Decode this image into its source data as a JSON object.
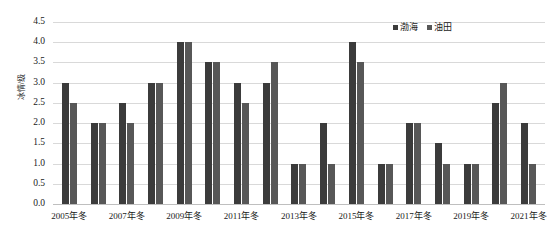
{
  "chart_data": {
    "type": "bar",
    "title": "",
    "subtitle": "",
    "xlabel": "",
    "ylabel": "冰情/级",
    "ylim": [
      0.0,
      4.5
    ],
    "ytick_step": 0.5,
    "yticks": [
      "0.0",
      "0.5",
      "1.0",
      "1.5",
      "2.0",
      "2.5",
      "3.0",
      "3.5",
      "4.0",
      "4.5"
    ],
    "ytick_values": [
      0.0,
      0.5,
      1.0,
      1.5,
      2.0,
      2.5,
      3.0,
      3.5,
      4.0,
      4.5
    ],
    "grid": true,
    "grid_axis": "y",
    "legend_position": "top-right",
    "categories": [
      "2005年冬",
      "2006年冬",
      "2007年冬",
      "2008年冬",
      "2009年冬",
      "2010年冬",
      "2011年冬",
      "2012年冬",
      "2013年冬",
      "2014年冬",
      "2015年冬",
      "2016年冬",
      "2017年冬",
      "2018年冬",
      "2019年冬",
      "2020年冬",
      "2021年冬"
    ],
    "xtick_labels": [
      "2005年冬",
      "",
      "2007年冬",
      "",
      "2009年冬",
      "",
      "2011年冬",
      "",
      "2013年冬",
      "",
      "2015年冬",
      "",
      "2017年冬",
      "",
      "2019年冬",
      "",
      "2021年冬"
    ],
    "series": [
      {
        "name": "渤海",
        "color": "#3b3b3b",
        "values": [
          3.0,
          2.0,
          2.5,
          3.0,
          4.0,
          3.5,
          3.0,
          3.0,
          1.0,
          2.0,
          4.0,
          1.0,
          2.0,
          1.5,
          1.0,
          2.5,
          2.0
        ]
      },
      {
        "name": "油田",
        "color": "#575757",
        "values": [
          2.5,
          2.0,
          2.0,
          3.0,
          4.0,
          3.5,
          2.5,
          3.5,
          1.0,
          1.0,
          3.5,
          1.0,
          2.0,
          1.0,
          1.0,
          3.0,
          1.0
        ]
      }
    ]
  }
}
